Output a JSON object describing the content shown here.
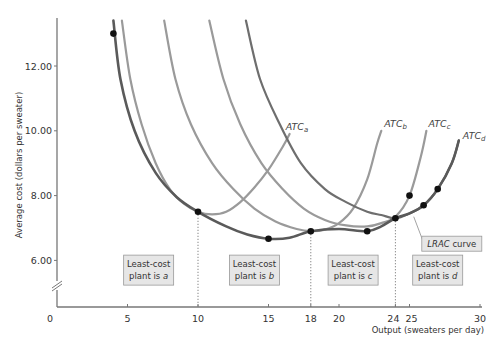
{
  "chart_data": {
    "type": "line",
    "title": "",
    "xlabel": "Output (sweaters per day)",
    "ylabel": "Average cost (dollars per sweater)",
    "xlim": [
      0,
      30
    ],
    "ylim": [
      5.0,
      13.5
    ],
    "y_axis_break": true,
    "x_ticks": [
      {
        "value": 0,
        "label": "0"
      },
      {
        "value": 5,
        "label": "5"
      },
      {
        "value": 10,
        "label": "10"
      },
      {
        "value": 15,
        "label": "15"
      },
      {
        "value": 18,
        "label": "18"
      },
      {
        "value": 20,
        "label": "20"
      },
      {
        "value": 24,
        "label": "24"
      },
      {
        "value": 25,
        "label": "25"
      },
      {
        "value": 30,
        "label": "30"
      }
    ],
    "y_ticks": [
      {
        "value": 6,
        "label": "6.00"
      },
      {
        "value": 8,
        "label": "8.00"
      },
      {
        "value": 10,
        "label": "10.00"
      },
      {
        "value": 12,
        "label": "12.00"
      }
    ],
    "series": [
      {
        "name": "ATCa",
        "label_main": "ATC",
        "label_sub": "a",
        "color": "#9a9a9a",
        "points": [
          [
            4.6,
            13.4
          ],
          [
            5.2,
            11.6
          ],
          [
            6.0,
            10.2
          ],
          [
            7.0,
            9.0
          ],
          [
            8.0,
            8.2
          ],
          [
            9.0,
            7.75
          ],
          [
            10.0,
            7.5
          ],
          [
            11.0,
            7.42
          ],
          [
            12.0,
            7.5
          ],
          [
            13.0,
            7.8
          ],
          [
            14.0,
            8.25
          ],
          [
            15.0,
            8.8
          ],
          [
            16.0,
            9.5
          ],
          [
            16.5,
            9.9
          ]
        ]
      },
      {
        "name": "ATCb",
        "label_main": "ATC",
        "label_sub": "b",
        "color": "#9a9a9a",
        "points": [
          [
            7.6,
            13.4
          ],
          [
            8.4,
            11.6
          ],
          [
            9.5,
            10.2
          ],
          [
            11.0,
            9.0
          ],
          [
            12.5,
            8.2
          ],
          [
            14.0,
            7.6
          ],
          [
            15.5,
            7.2
          ],
          [
            17.0,
            6.97
          ],
          [
            18.0,
            6.9
          ],
          [
            19.0,
            6.95
          ],
          [
            20.0,
            7.15
          ],
          [
            21.0,
            7.6
          ],
          [
            22.0,
            8.5
          ],
          [
            22.7,
            9.6
          ],
          [
            23.0,
            10.0
          ]
        ]
      },
      {
        "name": "ATCc",
        "label_main": "ATC",
        "label_sub": "c",
        "color": "#9a9a9a",
        "points": [
          [
            10.8,
            13.4
          ],
          [
            11.8,
            11.6
          ],
          [
            13.0,
            10.2
          ],
          [
            14.5,
            9.0
          ],
          [
            16.0,
            8.2
          ],
          [
            17.5,
            7.6
          ],
          [
            19.0,
            7.25
          ],
          [
            20.5,
            7.08
          ],
          [
            22.0,
            7.05
          ],
          [
            23.0,
            7.15
          ],
          [
            24.0,
            7.35
          ],
          [
            25.0,
            8.0
          ],
          [
            25.8,
            9.2
          ],
          [
            26.2,
            10.0
          ]
        ]
      },
      {
        "name": "ATCd",
        "label_main": "ATC",
        "label_sub": "d",
        "color": "#6e6e6e",
        "points": [
          [
            13.4,
            13.4
          ],
          [
            14.4,
            11.6
          ],
          [
            15.8,
            10.2
          ],
          [
            17.3,
            9.0
          ],
          [
            19.0,
            8.2
          ],
          [
            20.5,
            7.8
          ],
          [
            22.0,
            7.5
          ],
          [
            23.0,
            7.4
          ],
          [
            24.0,
            7.3
          ],
          [
            25.0,
            7.45
          ],
          [
            26.0,
            7.7
          ],
          [
            27.0,
            8.2
          ],
          [
            28.0,
            9.0
          ],
          [
            28.5,
            9.7
          ]
        ]
      },
      {
        "name": "LRAC curve",
        "label_main": "LRAC",
        "label_suffix": " curve",
        "color": "#5a5a5a",
        "points": [
          [
            4.0,
            13.4
          ],
          [
            4.5,
            11.6
          ],
          [
            5.5,
            10.0
          ],
          [
            7.0,
            8.7
          ],
          [
            8.5,
            7.95
          ],
          [
            10.0,
            7.5
          ],
          [
            12.0,
            7.05
          ],
          [
            13.5,
            6.8
          ],
          [
            15.0,
            6.67
          ],
          [
            16.5,
            6.7
          ],
          [
            18.0,
            6.9
          ],
          [
            20.0,
            6.97
          ],
          [
            22.0,
            6.9
          ],
          [
            23.0,
            7.05
          ],
          [
            24.0,
            7.3
          ],
          [
            25.0,
            7.45
          ],
          [
            26.0,
            7.7
          ],
          [
            27.0,
            8.2
          ],
          [
            28.0,
            9.0
          ],
          [
            28.5,
            9.7
          ]
        ]
      }
    ],
    "highlight_points": [
      [
        4,
        13.0
      ],
      [
        10,
        7.5
      ],
      [
        15,
        6.67
      ],
      [
        18,
        6.9
      ],
      [
        22,
        6.9
      ],
      [
        24,
        7.3
      ],
      [
        25,
        8.0
      ],
      [
        26,
        7.7
      ],
      [
        27,
        8.2
      ]
    ],
    "dotted_guides": [
      10,
      18,
      24
    ],
    "annotations": [
      {
        "line1": "Least-cost",
        "line2": "plant is",
        "italic": "a",
        "x_center": 6.5,
        "y_center": 5.7
      },
      {
        "line1": "Least-cost",
        "line2": "plant is",
        "italic": "b",
        "x_center": 14.0,
        "y_center": 5.7
      },
      {
        "line1": "Least-cost",
        "line2": "plant is",
        "italic": "c",
        "x_center": 21.0,
        "y_center": 5.7
      },
      {
        "line1": "Least-cost",
        "line2": "plant is",
        "italic": "d",
        "x_center": 27.0,
        "y_center": 5.7
      }
    ],
    "lrac_label": {
      "italic": "LRAC",
      "text": " curve",
      "x_center": 28.0,
      "y_center": 6.5,
      "pointer_to": [
        25.3,
        7.35
      ]
    },
    "grid": false
  }
}
